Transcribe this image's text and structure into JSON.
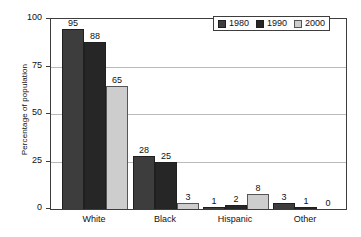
{
  "chart_data": {
    "type": "bar",
    "title": "",
    "subtitle": "",
    "xlabel": "",
    "ylabel": "Percentage of population",
    "categories": [
      "White",
      "Black",
      "Hispanic",
      "Other"
    ],
    "series": [
      {
        "name": "1980",
        "color": "#3d3d3d",
        "values": [
          95,
          28,
          1,
          3
        ]
      },
      {
        "name": "1990",
        "color": "#262626",
        "values": [
          88,
          25,
          2,
          1
        ]
      },
      {
        "name": "2000",
        "color": "#cdcdcd",
        "values": [
          65,
          3,
          8,
          0
        ]
      }
    ],
    "ylim": [
      0,
      100
    ],
    "yticks": [
      0,
      25,
      50,
      75,
      100
    ],
    "ytick_labels": [
      "0",
      "25",
      "50",
      "75",
      "100"
    ],
    "grid": "horizontal",
    "legend_position": "top-right",
    "data_labels": true,
    "annotations": []
  },
  "axes": {
    "y_title": "Percentage of population",
    "y_ticks": [
      {
        "value": 100,
        "label": "100"
      },
      {
        "value": 75,
        "label": "75"
      },
      {
        "value": 50,
        "label": "50"
      },
      {
        "value": 25,
        "label": "25"
      },
      {
        "value": 0,
        "label": "0"
      }
    ],
    "x_categories": [
      {
        "label": "White"
      },
      {
        "label": "Black"
      },
      {
        "label": "Hispanic"
      },
      {
        "label": "Other"
      }
    ]
  },
  "legend": {
    "items": [
      {
        "label": "1980",
        "color": "#3d3d3d"
      },
      {
        "label": "1990",
        "color": "#262626"
      },
      {
        "label": "2000",
        "color": "#cdcdcd"
      }
    ]
  },
  "bars": {
    "white": [
      {
        "series": "1980",
        "value": 95,
        "label": "95"
      },
      {
        "series": "1990",
        "value": 88,
        "label": "88"
      },
      {
        "series": "2000",
        "value": 65,
        "label": "65"
      }
    ],
    "black": [
      {
        "series": "1980",
        "value": 28,
        "label": "28"
      },
      {
        "series": "1990",
        "value": 25,
        "label": "25"
      },
      {
        "series": "2000",
        "value": 3,
        "label": "3"
      }
    ],
    "hispanic": [
      {
        "series": "1980",
        "value": 1,
        "label": "1"
      },
      {
        "series": "1990",
        "value": 2,
        "label": "2"
      },
      {
        "series": "2000",
        "value": 8,
        "label": "8"
      }
    ],
    "other": [
      {
        "series": "1980",
        "value": 3,
        "label": "3"
      },
      {
        "series": "1990",
        "value": 1,
        "label": "1"
      },
      {
        "series": "2000",
        "value": 0,
        "label": "0"
      }
    ]
  }
}
